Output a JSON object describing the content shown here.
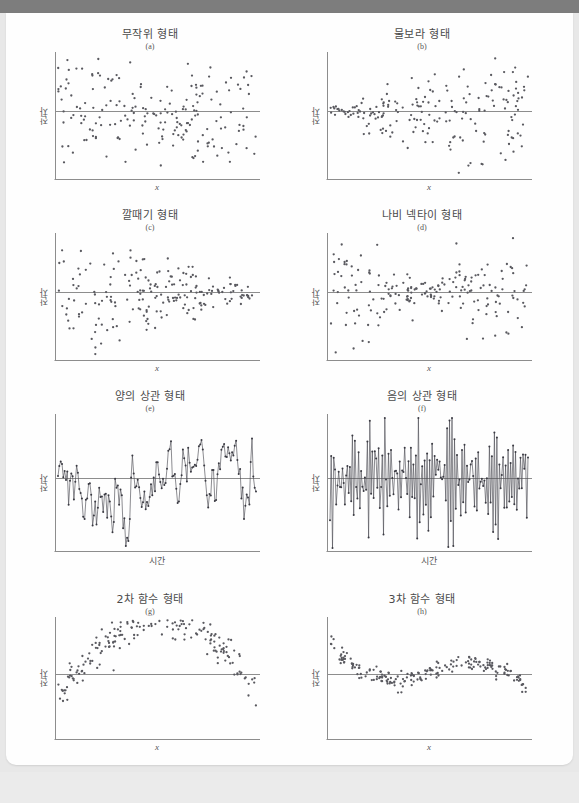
{
  "document": {
    "kind": "textbook-figure-page",
    "axis_labels": {
      "y": "잔차",
      "x_variable": "x",
      "x_time": "시간"
    },
    "colors": {
      "top_bar": "#7d7d7d",
      "paper": "#fefefe",
      "page_backdrop": "#e8e8e8",
      "axis": "#8d8d8d",
      "zero_line": "#8d8d8d",
      "marker": "#59595f",
      "title_text": "#4a4a4a"
    }
  },
  "panels": [
    {
      "id": "a",
      "title": "무작위 형태",
      "sub": "(a)",
      "ylabel": "잔차",
      "xlabel": "x",
      "xlabel_style": "italic",
      "plot_type": "scatter",
      "pattern": "random"
    },
    {
      "id": "b",
      "title": "물보라 형태",
      "sub": "(b)",
      "ylabel": "잔차",
      "xlabel": "x",
      "xlabel_style": "italic",
      "plot_type": "scatter",
      "pattern": "megaphone-right"
    },
    {
      "id": "c",
      "title": "깔때기 형태",
      "sub": "(c)",
      "ylabel": "잔차",
      "xlabel": "x",
      "xlabel_style": "italic",
      "plot_type": "scatter",
      "pattern": "funnel-left"
    },
    {
      "id": "d",
      "title": "나비 넥타이 형태",
      "sub": "(d)",
      "ylabel": "잔차",
      "xlabel": "x",
      "xlabel_style": "italic",
      "plot_type": "scatter",
      "pattern": "bowtie"
    },
    {
      "id": "e",
      "title": "양의 상관 형태",
      "sub": "(e)",
      "ylabel": "잔차",
      "xlabel": "시간",
      "xlabel_style": "normal",
      "plot_type": "line",
      "pattern": "positive-autocorrelation"
    },
    {
      "id": "f",
      "title": "음의 상관 형태",
      "sub": "(f)",
      "ylabel": "잔차",
      "xlabel": "시간",
      "xlabel_style": "normal",
      "plot_type": "line",
      "pattern": "negative-autocorrelation"
    },
    {
      "id": "g",
      "title": "2차 함수 형태",
      "sub": "(g)",
      "ylabel": "잔차",
      "xlabel": "x",
      "xlabel_style": "italic",
      "plot_type": "scatter",
      "pattern": "quadratic"
    },
    {
      "id": "h",
      "title": "3차 함수 형태",
      "sub": "(h)",
      "ylabel": "잔차",
      "xlabel": "x",
      "xlabel_style": "italic",
      "plot_type": "scatter",
      "pattern": "cubic"
    }
  ],
  "chart_data": {
    "type": "scatter",
    "xlabel": "x",
    "ylabel": "잔차",
    "grid": false,
    "legend": "none",
    "panels": [
      {
        "id": "a",
        "title": "무작위 형태",
        "sub": "(a)",
        "type": "scatter",
        "xlabel": "x",
        "ylabel": "잔차",
        "xlim": [
          0,
          1
        ],
        "ylim": [
          -1,
          1
        ],
        "description": "잔차가 0을 중심으로 일정한 분산으로 무작위 분포",
        "n_points": 200,
        "spread_profile": "constant"
      },
      {
        "id": "b",
        "title": "물보라 형태",
        "sub": "(b)",
        "type": "scatter",
        "xlabel": "x",
        "ylabel": "잔차",
        "xlim": [
          0,
          1
        ],
        "ylim": [
          -1,
          1
        ],
        "description": "왼쪽에서 오른쪽으로 갈수록 분산이 커지는 나팔 모양",
        "n_points": 200,
        "spread_profile": "increasing"
      },
      {
        "id": "c",
        "title": "깔때기 형태",
        "sub": "(c)",
        "type": "scatter",
        "xlabel": "x",
        "ylabel": "잔차",
        "xlim": [
          0,
          1
        ],
        "ylim": [
          -1,
          1
        ],
        "description": "왼쪽에서 오른쪽으로 갈수록 분산이 작아지는 깔때기 모양",
        "n_points": 200,
        "spread_profile": "decreasing"
      },
      {
        "id": "d",
        "title": "나비 넥타이 형태",
        "sub": "(d)",
        "type": "scatter",
        "xlabel": "x",
        "ylabel": "잔차",
        "xlim": [
          0,
          1
        ],
        "ylim": [
          -1,
          1
        ],
        "description": "양쪽 끝에서 분산이 크고 가운데에서 작아지는 나비 넥타이 모양",
        "n_points": 200,
        "spread_profile": "wide-narrow-wide"
      },
      {
        "id": "e",
        "title": "양의 상관 형태",
        "sub": "(e)",
        "type": "line",
        "xlabel": "시간",
        "ylabel": "잔차",
        "xlim": [
          0,
          1
        ],
        "ylim": [
          -1,
          1
        ],
        "description": "연속된 잔차가 같은 부호로 이어지는 양의 자기상관",
        "n_points": 150,
        "autocorrelation": "positive"
      },
      {
        "id": "f",
        "title": "음의 상관 형태",
        "sub": "(f)",
        "type": "line",
        "xlabel": "시간",
        "ylabel": "잔차",
        "xlim": [
          0,
          1
        ],
        "ylim": [
          -1,
          1
        ],
        "description": "연속된 잔차가 부호를 번갈아 가며 진동하는 음의 자기상관",
        "n_points": 160,
        "autocorrelation": "negative"
      },
      {
        "id": "g",
        "title": "2차 함수 형태",
        "sub": "(g)",
        "type": "scatter",
        "xlabel": "x",
        "ylabel": "잔차",
        "xlim": [
          0,
          1
        ],
        "ylim": [
          -1,
          1
        ],
        "description": "아래로 볼록한 U자 곡선 형태의 체계적 잔차",
        "n_points": 200,
        "curve": "quadratic"
      },
      {
        "id": "h",
        "title": "3차 함수 형태",
        "sub": "(h)",
        "type": "scatter",
        "xlabel": "x",
        "ylabel": "잔차",
        "xlim": [
          0,
          1
        ],
        "ylim": [
          -1,
          1
        ],
        "description": "상승 후 하강했다 다시 급상승하는 3차 곡선 형태의 잔차",
        "n_points": 200,
        "curve": "cubic"
      }
    ]
  }
}
